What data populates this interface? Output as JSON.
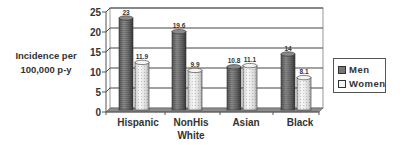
{
  "chart_data": {
    "type": "bar",
    "style": "3d-cylinder",
    "title": "",
    "xlabel": "",
    "ylabel": "Incidence per 100,000 p-y",
    "ylabel_lines": [
      "Incidence per",
      "100,000 p-y"
    ],
    "ylim": [
      0,
      25
    ],
    "yticks": [
      0,
      5,
      10,
      15,
      20,
      25
    ],
    "grid": true,
    "legend_position": "right",
    "categories": [
      "Hispanic",
      "NonHis White",
      "Asian",
      "Black"
    ],
    "category_lines": [
      [
        "Hispanic"
      ],
      [
        "NonHis",
        "White"
      ],
      [
        "Asian"
      ],
      [
        "Black"
      ]
    ],
    "series": [
      {
        "name": "Men",
        "values": [
          23,
          19.6,
          10.8,
          14
        ],
        "labels": [
          "23",
          "19.6",
          "10.8",
          "14"
        ],
        "color": "#6e6e6e"
      },
      {
        "name": "Women",
        "values": [
          11.9,
          9.9,
          11.1,
          8.1
        ],
        "labels": [
          "11.9",
          "9.9",
          "11.1",
          "8.1"
        ],
        "color": "#e8e8e8"
      }
    ]
  },
  "legend": {
    "men": "Men",
    "women": "Women"
  }
}
